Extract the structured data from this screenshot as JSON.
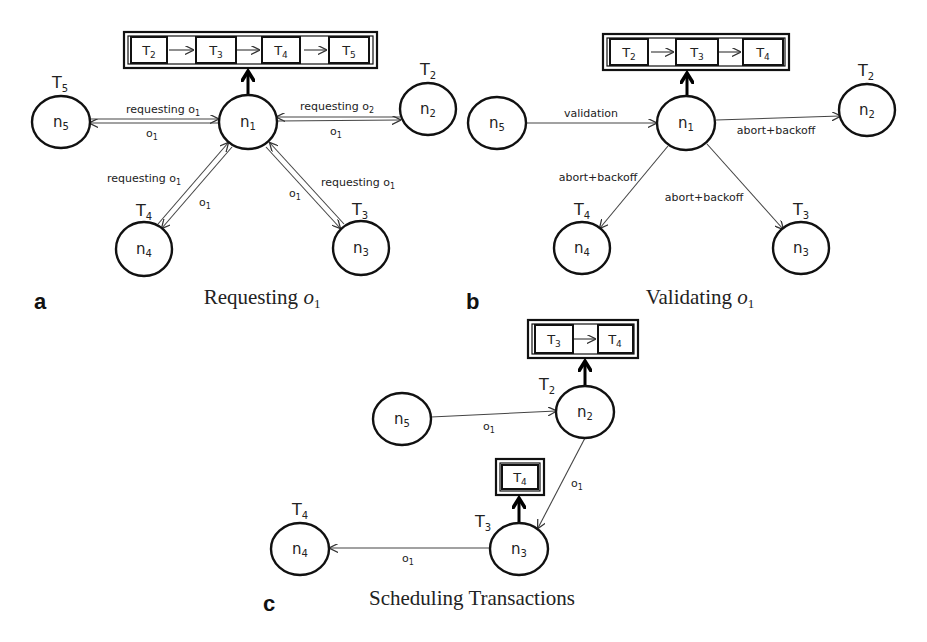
{
  "figure": {
    "panels": [
      {
        "id": "a",
        "letter": "a",
        "caption": "Requesting o",
        "caption_sub": "1",
        "queue": {
          "items": [
            {
              "label": "T",
              "sub": "2"
            },
            {
              "label": "T",
              "sub": "3"
            },
            {
              "label": "T",
              "sub": "4"
            },
            {
              "label": "T",
              "sub": "5"
            }
          ]
        },
        "nodes": [
          {
            "id": "n1",
            "label": "n",
            "sub": "1",
            "tx": null,
            "tx_sub": null
          },
          {
            "id": "n2",
            "label": "n",
            "sub": "2",
            "tx": "T",
            "tx_sub": "2"
          },
          {
            "id": "n3",
            "label": "n",
            "sub": "3",
            "tx": "T",
            "tx_sub": "3"
          },
          {
            "id": "n4",
            "label": "n",
            "sub": "4",
            "tx": "T",
            "tx_sub": "4"
          },
          {
            "id": "n5",
            "label": "n",
            "sub": "5",
            "tx": "T",
            "tx_sub": "5"
          }
        ],
        "edges": [
          {
            "from": "n5",
            "to": "n1",
            "request_label": "requesting o",
            "request_sub": "1",
            "reply_label": "o",
            "reply_sub": "1"
          },
          {
            "from": "n2",
            "to": "n1",
            "request_label": "requesting o",
            "request_sub": "2",
            "reply_label": "o",
            "reply_sub": "1"
          },
          {
            "from": "n4",
            "to": "n1",
            "request_label": "requesting o",
            "request_sub": "1",
            "reply_label": "o",
            "reply_sub": "1"
          },
          {
            "from": "n3",
            "to": "n1",
            "request_label": "requesting o",
            "request_sub": "1",
            "reply_label": "o",
            "reply_sub": "1"
          }
        ]
      },
      {
        "id": "b",
        "letter": "b",
        "caption": "Validating o",
        "caption_sub": "1",
        "queue": {
          "items": [
            {
              "label": "T",
              "sub": "2"
            },
            {
              "label": "T",
              "sub": "3"
            },
            {
              "label": "T",
              "sub": "4"
            }
          ]
        },
        "nodes": [
          {
            "id": "n1",
            "label": "n",
            "sub": "1",
            "tx": null,
            "tx_sub": null
          },
          {
            "id": "n2",
            "label": "n",
            "sub": "2",
            "tx": "T",
            "tx_sub": "2"
          },
          {
            "id": "n3",
            "label": "n",
            "sub": "3",
            "tx": "T",
            "tx_sub": "3"
          },
          {
            "id": "n4",
            "label": "n",
            "sub": "4",
            "tx": "T",
            "tx_sub": "4"
          },
          {
            "id": "n5",
            "label": "n",
            "sub": "5",
            "tx": null,
            "tx_sub": null
          }
        ],
        "edges": [
          {
            "from": "n5",
            "to": "n1",
            "label": "validation"
          },
          {
            "from": "n1",
            "to": "n2",
            "label": "abort+backoff"
          },
          {
            "from": "n1",
            "to": "n4",
            "label": "abort+backoff"
          },
          {
            "from": "n1",
            "to": "n3",
            "label": "abort+backoff"
          }
        ]
      },
      {
        "id": "c",
        "letter": "c",
        "caption": "Scheduling Transactions",
        "queues": [
          {
            "owner": "n2",
            "items": [
              {
                "label": "T",
                "sub": "3"
              },
              {
                "label": "T",
                "sub": "4"
              }
            ]
          },
          {
            "owner": "n3",
            "items": [
              {
                "label": "T",
                "sub": "4"
              }
            ]
          }
        ],
        "nodes": [
          {
            "id": "n2",
            "label": "n",
            "sub": "2",
            "tx": "T",
            "tx_sub": "2"
          },
          {
            "id": "n3",
            "label": "n",
            "sub": "3",
            "tx": "T",
            "tx_sub": "3"
          },
          {
            "id": "n4",
            "label": "n",
            "sub": "4",
            "tx": "T",
            "tx_sub": "4"
          },
          {
            "id": "n5",
            "label": "n",
            "sub": "5",
            "tx": null,
            "tx_sub": null
          }
        ],
        "edges": [
          {
            "from": "n5",
            "to": "n2",
            "label": "o",
            "sub": "1"
          },
          {
            "from": "n2",
            "to": "n3",
            "label": "o",
            "sub": "1"
          },
          {
            "from": "n3",
            "to": "n4",
            "label": "o",
            "sub": "1"
          }
        ]
      }
    ]
  }
}
